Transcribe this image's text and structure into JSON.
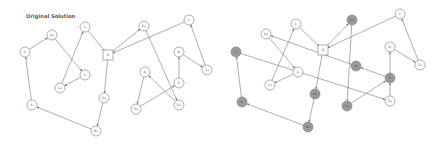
{
  "title": "Original Solution",
  "colors": {
    "edge": "#777777",
    "node_fill": "#ffffff",
    "node_fill_highlighted": "#9a9a9a",
    "node_stroke": "#777777",
    "title": "#555555"
  },
  "panels": [
    {
      "id": "original",
      "title": "Original Solution",
      "offset_x": 0,
      "nodes": [
        {
          "id": "n0",
          "label": "0",
          "x": 108,
          "y": 55,
          "shape": "square",
          "highlighted": false
        },
        {
          "id": "n1m",
          "label": "1-",
          "x": 85,
          "y": 27,
          "shape": "circle",
          "highlighted": false
        },
        {
          "id": "n2p",
          "label": "2+",
          "x": 52,
          "y": 35,
          "shape": "circle",
          "highlighted": false
        },
        {
          "id": "n6",
          "label": "6-",
          "x": 25,
          "y": 52,
          "shape": "circle",
          "highlighted": false
        },
        {
          "id": "n1b",
          "label": "1-",
          "x": 85,
          "y": 75,
          "shape": "circle",
          "highlighted": false
        },
        {
          "id": "n1p",
          "label": "1+",
          "x": 60,
          "y": 88,
          "shape": "circle",
          "highlighted": false
        },
        {
          "id": "n6p",
          "label": "6+",
          "x": 144,
          "y": 26,
          "shape": "circle",
          "highlighted": false
        },
        {
          "id": "n7",
          "label": "7-",
          "x": 189,
          "y": 20,
          "shape": "circle",
          "highlighted": false
        },
        {
          "id": "n0m",
          "label": "0-",
          "x": 179,
          "y": 52,
          "shape": "circle",
          "highlighted": false
        },
        {
          "id": "n7p",
          "label": "7+",
          "x": 207,
          "y": 70,
          "shape": "circle",
          "highlighted": false
        },
        {
          "id": "n4",
          "label": "4-",
          "x": 145,
          "y": 72,
          "shape": "circle",
          "highlighted": false
        },
        {
          "id": "n3",
          "label": "3-",
          "x": 179,
          "y": 83,
          "shape": "circle",
          "highlighted": false
        },
        {
          "id": "n3p",
          "label": "3+",
          "x": 136,
          "y": 109,
          "shape": "circle",
          "highlighted": false
        },
        {
          "id": "n5p",
          "label": "5+",
          "x": 179,
          "y": 105,
          "shape": "circle",
          "highlighted": false
        },
        {
          "id": "n6m",
          "label": "6-",
          "x": 32,
          "y": 105,
          "shape": "circle",
          "highlighted": false
        },
        {
          "id": "n6q",
          "label": "6+",
          "x": 104,
          "y": 98,
          "shape": "circle",
          "highlighted": false
        },
        {
          "id": "n8p",
          "label": "8+",
          "x": 96,
          "y": 131,
          "shape": "circle",
          "highlighted": false
        }
      ],
      "edges": [
        {
          "from": "n1m",
          "to": "n0"
        },
        {
          "from": "n0",
          "to": "n6p"
        },
        {
          "from": "n7",
          "to": "n0"
        },
        {
          "from": "n6p",
          "to": "n5p"
        },
        {
          "from": "n7p",
          "to": "n7"
        },
        {
          "from": "n0m",
          "to": "n7p"
        },
        {
          "from": "n3",
          "to": "n0m"
        },
        {
          "from": "n5p",
          "to": "n4"
        },
        {
          "from": "n4",
          "to": "n3p"
        },
        {
          "from": "n3p",
          "to": "n3"
        },
        {
          "from": "n0",
          "to": "n6q"
        },
        {
          "from": "n6q",
          "to": "n8p"
        },
        {
          "from": "n8p",
          "to": "n6m"
        },
        {
          "from": "n6m",
          "to": "n6"
        },
        {
          "from": "n6",
          "to": "n2p"
        },
        {
          "from": "n2p",
          "to": "n1b"
        },
        {
          "from": "n1b",
          "to": "n1p"
        },
        {
          "from": "n1p",
          "to": "n1m"
        }
      ]
    },
    {
      "id": "modified",
      "title": "",
      "offset_x": 222,
      "nodes": [
        {
          "id": "m0",
          "label": "0",
          "x": 101,
          "y": 50,
          "shape": "square",
          "highlighted": false
        },
        {
          "id": "m1m",
          "label": "1-",
          "x": 74,
          "y": 24,
          "shape": "circle",
          "highlighted": false
        },
        {
          "id": "m2p",
          "label": "2+",
          "x": 44,
          "y": 34,
          "shape": "circle",
          "highlighted": false
        },
        {
          "id": "m6m",
          "label": "6-",
          "x": 14,
          "y": 52,
          "shape": "circle",
          "highlighted": true
        },
        {
          "id": "m1b",
          "label": "1-",
          "x": 76,
          "y": 72,
          "shape": "circle",
          "highlighted": false
        },
        {
          "id": "m1p",
          "label": "1+",
          "x": 48,
          "y": 85,
          "shape": "circle",
          "highlighted": false
        },
        {
          "id": "m6p",
          "label": "6+",
          "x": 130,
          "y": 20,
          "shape": "circle",
          "highlighted": true
        },
        {
          "id": "m7",
          "label": "7-",
          "x": 178,
          "y": 14,
          "shape": "circle",
          "highlighted": false
        },
        {
          "id": "m0m",
          "label": "0-",
          "x": 168,
          "y": 47,
          "shape": "circle",
          "highlighted": false
        },
        {
          "id": "m7p",
          "label": "7+",
          "x": 198,
          "y": 65,
          "shape": "circle",
          "highlighted": false
        },
        {
          "id": "m4",
          "label": "4-",
          "x": 134,
          "y": 66,
          "shape": "circle",
          "highlighted": true
        },
        {
          "id": "m3",
          "label": "3-",
          "x": 168,
          "y": 78,
          "shape": "circle",
          "highlighted": true
        },
        {
          "id": "m3p",
          "label": "3+",
          "x": 125,
          "y": 106,
          "shape": "circle",
          "highlighted": true
        },
        {
          "id": "m5p",
          "label": "5+",
          "x": 168,
          "y": 101,
          "shape": "circle",
          "highlighted": false
        },
        {
          "id": "m6n",
          "label": "6-",
          "x": 20,
          "y": 102,
          "shape": "circle",
          "highlighted": true
        },
        {
          "id": "m6q",
          "label": "6+",
          "x": 93,
          "y": 94,
          "shape": "circle",
          "highlighted": true
        },
        {
          "id": "m8p",
          "label": "8+",
          "x": 86,
          "y": 127,
          "shape": "circle",
          "highlighted": true
        }
      ],
      "edges": [
        {
          "from": "m1m",
          "to": "m0"
        },
        {
          "from": "m0",
          "to": "m6p"
        },
        {
          "from": "m7",
          "to": "m0"
        },
        {
          "from": "m6p",
          "to": "m3p"
        },
        {
          "from": "m7p",
          "to": "m7"
        },
        {
          "from": "m0m",
          "to": "m7p"
        },
        {
          "from": "m3",
          "to": "m0m"
        },
        {
          "from": "m3",
          "to": "m4"
        },
        {
          "from": "m4",
          "to": "m2p"
        },
        {
          "from": "m3p",
          "to": "m3"
        },
        {
          "from": "m5p",
          "to": "m3"
        },
        {
          "from": "m0",
          "to": "m6q"
        },
        {
          "from": "m6q",
          "to": "m8p"
        },
        {
          "from": "m8p",
          "to": "m6n"
        },
        {
          "from": "m6n",
          "to": "m6m"
        },
        {
          "from": "m6m",
          "to": "m5p"
        },
        {
          "from": "m2p",
          "to": "m1b"
        },
        {
          "from": "m1b",
          "to": "m1p"
        },
        {
          "from": "m1p",
          "to": "m1m"
        }
      ]
    }
  ]
}
